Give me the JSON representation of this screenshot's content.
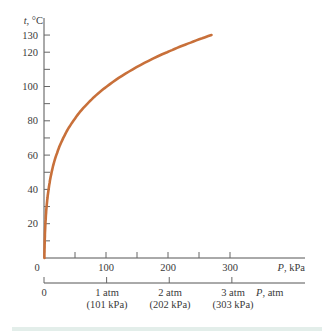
{
  "chart_data": {
    "type": "line",
    "title": "",
    "xlabel": "P, kPa",
    "xlabel_secondary": "P, atm",
    "ylabel": "t, °C",
    "xlim": [
      0,
      350
    ],
    "ylim": [
      0,
      135
    ],
    "grid": false,
    "legend": null,
    "y_ticks": [
      20,
      40,
      60,
      80,
      100,
      120,
      130
    ],
    "y_minor_tick_step": 10,
    "x_ticks": [
      0,
      100,
      200,
      300
    ],
    "x_minor_tick_step": 50,
    "x_secondary_ticks": [
      {
        "value_kpa": 0,
        "label": "0",
        "sub": ""
      },
      {
        "value_kpa": 101,
        "label": "1 atm",
        "sub": "(101 kPa)"
      },
      {
        "value_kpa": 202,
        "label": "2 atm",
        "sub": "(202 kPa)"
      },
      {
        "value_kpa": 303,
        "label": "3 atm",
        "sub": "(303 kPa)"
      }
    ],
    "series": [
      {
        "name": "Boiling point of water vs. pressure",
        "color": "#c8703a",
        "x": [
          0.6,
          1.2,
          2.3,
          4.2,
          7.4,
          12.3,
          19.9,
          31.2,
          47.4,
          70.1,
          101.3,
          143.3,
          198.5,
          232.0,
          270.1
        ],
        "y": [
          0,
          10,
          20,
          30,
          40,
          50,
          60,
          70,
          80,
          90,
          100,
          110,
          120,
          125,
          130
        ]
      }
    ]
  },
  "labels": {
    "y_axis": "t, °C",
    "x_axis": "P, kPa",
    "x_axis_secondary": "P, atm",
    "origin": "0",
    "x_tick_100": "100",
    "x_tick_200": "200",
    "x_tick_300": "300",
    "y_tick_20": "20",
    "y_tick_40": "40",
    "y_tick_60": "60",
    "y_tick_80": "80",
    "y_tick_100": "100",
    "y_tick_120": "120",
    "y_tick_130": "130",
    "atm_0": "0",
    "atm_1": "1 atm",
    "atm_1_sub": "(101 kPa)",
    "atm_2": "2 atm",
    "atm_2_sub": "(202 kPa)",
    "atm_3": "3 atm",
    "atm_3_sub": "(303 kPa)"
  }
}
